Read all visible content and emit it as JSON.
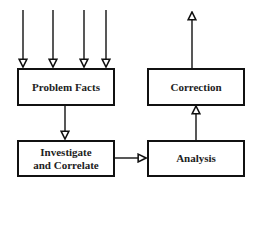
{
  "diagram": {
    "type": "flowchart",
    "nodes": [
      {
        "id": "problem_facts",
        "label": "Problem Facts"
      },
      {
        "id": "correction",
        "label": "Correction"
      },
      {
        "id": "investigate",
        "label": "Investigate and Correlate"
      },
      {
        "id": "analysis",
        "label": "Analysis"
      }
    ],
    "edges": [
      {
        "from": "input_1",
        "to": "problem_facts"
      },
      {
        "from": "input_2",
        "to": "problem_facts"
      },
      {
        "from": "input_3",
        "to": "problem_facts"
      },
      {
        "from": "input_4",
        "to": "problem_facts"
      },
      {
        "from": "problem_facts",
        "to": "investigate"
      },
      {
        "from": "investigate",
        "to": "analysis"
      },
      {
        "from": "analysis",
        "to": "correction"
      },
      {
        "from": "correction",
        "to": "output"
      }
    ],
    "colors": {
      "stroke": "#111111",
      "background": "#ffffff",
      "text": "#222222"
    }
  }
}
